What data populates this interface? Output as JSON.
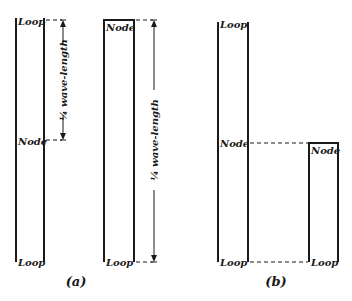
{
  "figure": {
    "panels": [
      {
        "caption": "(a)",
        "pipes": [
          {
            "type": "open",
            "labels": {
              "top": "Loop",
              "middle": "Node",
              "bottom": "Loop"
            },
            "dimension_label": "¼ wave-length"
          },
          {
            "type": "closed",
            "labels": {
              "top": "Node",
              "bottom": "Loop"
            },
            "dimension_label": "¼ wave-length"
          }
        ]
      },
      {
        "caption": "(b)",
        "pipes": [
          {
            "type": "open",
            "labels": {
              "top": "Loop",
              "middle": "Node",
              "bottom": "Loop"
            }
          },
          {
            "type": "closed",
            "labels": {
              "top": "Node",
              "bottom": "Loop"
            }
          }
        ]
      }
    ]
  }
}
